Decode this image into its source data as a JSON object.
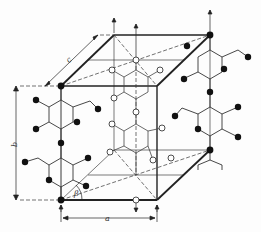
{
  "figure": {
    "labels": {
      "a": "a",
      "b": "b",
      "c": "c",
      "beta": "β"
    },
    "colors": {
      "line": "#222222",
      "atom_filled": "#111111",
      "atom_open": "#ffffff",
      "background": "#fdfdfd"
    },
    "legend": {
      "filled_atoms": "corner chains (black circles)",
      "open_atoms": "center chain (white circles)"
    }
  }
}
